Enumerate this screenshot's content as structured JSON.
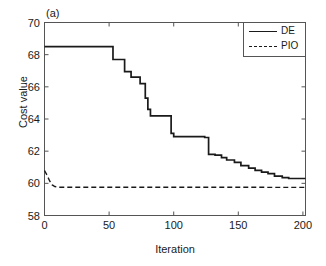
{
  "figure": {
    "panel_label": "(a)",
    "background": "#ffffff",
    "line_color": "#1a1a1a"
  },
  "chart_data": {
    "type": "line",
    "title": "",
    "panel": "(a)",
    "xlabel": "Iteration",
    "ylabel": "Cost value",
    "xlim": [
      0,
      202
    ],
    "ylim": [
      58,
      70
    ],
    "xticks": [
      0,
      50,
      100,
      150,
      200
    ],
    "yticks": [
      58,
      60,
      62,
      64,
      66,
      68,
      70
    ],
    "grid": false,
    "legend_position": "top-right",
    "step_style": "post",
    "series": [
      {
        "name": "DE",
        "style": "solid",
        "color": "#1a1a1a",
        "x": [
          0,
          53,
          53,
          62,
          62,
          67,
          67,
          74,
          74,
          78,
          78,
          80,
          80,
          82,
          82,
          96,
          96,
          98,
          98,
          100,
          100,
          124,
          124,
          127,
          127,
          132,
          132,
          137,
          137,
          141,
          141,
          147,
          147,
          152,
          152,
          158,
          158,
          163,
          163,
          168,
          168,
          173,
          173,
          178,
          178,
          184,
          184,
          189,
          189,
          202
        ],
        "y": [
          68.5,
          68.5,
          67.7,
          67.7,
          66.95,
          66.95,
          66.6,
          66.6,
          66.2,
          66.2,
          65.3,
          65.3,
          64.6,
          64.6,
          64.2,
          64.2,
          64.2,
          64.2,
          63.1,
          63.1,
          62.9,
          62.9,
          62.85,
          62.85,
          61.8,
          61.8,
          61.75,
          61.75,
          61.6,
          61.6,
          61.45,
          61.45,
          61.3,
          61.3,
          61.1,
          61.1,
          60.95,
          60.95,
          60.8,
          60.8,
          60.7,
          60.7,
          60.6,
          60.6,
          60.45,
          60.45,
          60.35,
          60.35,
          60.3,
          60.3
        ],
        "start_value": 68.5,
        "final_value": 60.3
      },
      {
        "name": "PIO",
        "style": "dashed",
        "color": "#1a1a1a",
        "x": [
          0,
          2,
          4,
          6,
          8,
          10,
          200,
          202
        ],
        "y": [
          60.8,
          60.5,
          60.15,
          59.9,
          59.8,
          59.76,
          59.75,
          59.75
        ],
        "start_value": 60.8,
        "final_value": 59.75
      }
    ]
  },
  "legend": {
    "entries": [
      {
        "label": "DE",
        "style": "solid"
      },
      {
        "label": "PIO",
        "style": "dashed"
      }
    ]
  },
  "axes": {
    "y_tick_labels": [
      "70",
      "68",
      "66",
      "64",
      "62",
      "60",
      "58"
    ],
    "x_tick_labels": [
      "0",
      "50",
      "100",
      "150",
      "200"
    ],
    "y_title": "Cost value",
    "x_title": "Iteration"
  }
}
